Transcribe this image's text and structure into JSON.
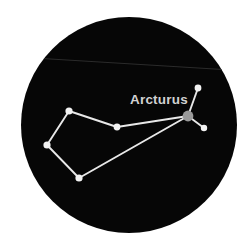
{
  "chart_data": {
    "type": "scatter",
    "title": "",
    "subtitle": "",
    "xlabel": "",
    "ylabel": "",
    "constellation": "Bootes",
    "view": {
      "shape": "circle",
      "center_x": 129,
      "center_y": 125,
      "radius": 108,
      "sky_color": "#060606",
      "page_background": "#ffffff"
    },
    "grid": false,
    "legend": null,
    "xlim": [
      0,
      252
    ],
    "ylim": [
      0,
      252
    ],
    "stars": [
      {
        "id": "arcturus",
        "label": "Arcturus",
        "x": 188,
        "y": 116,
        "radius": 5.4,
        "color": "#9a9a9a",
        "magnitude_rank": 1
      },
      {
        "id": "izar",
        "label": "",
        "x": 198,
        "y": 88,
        "radius": 3.4,
        "color": "#f2f2f2",
        "magnitude_rank": 2
      },
      {
        "id": "muphrid",
        "label": "",
        "x": 204,
        "y": 128,
        "radius": 3.2,
        "color": "#f2f2f2",
        "magnitude_rank": 3
      },
      {
        "id": "seginus",
        "label": "",
        "x": 117,
        "y": 127,
        "radius": 3.4,
        "color": "#f2f2f2",
        "magnitude_rank": 4
      },
      {
        "id": "nekkar",
        "label": "",
        "x": 69,
        "y": 111,
        "radius": 3.6,
        "color": "#f2f2f2",
        "magnitude_rank": 5
      },
      {
        "id": "asellus",
        "label": "",
        "x": 47,
        "y": 145,
        "radius": 3.6,
        "color": "#f2f2f2",
        "magnitude_rank": 6
      },
      {
        "id": "alkalurops",
        "label": "",
        "x": 79,
        "y": 178,
        "radius": 3.6,
        "color": "#f2f2f2",
        "magnitude_rank": 7
      }
    ],
    "lines": [
      {
        "from": "izar",
        "to": "arcturus"
      },
      {
        "from": "arcturus",
        "to": "muphrid"
      },
      {
        "from": "arcturus",
        "to": "seginus"
      },
      {
        "from": "seginus",
        "to": "nekkar"
      },
      {
        "from": "nekkar",
        "to": "asellus"
      },
      {
        "from": "asellus",
        "to": "alkalurops"
      },
      {
        "from": "alkalurops",
        "to": "arcturus"
      }
    ],
    "line_color": "#e8e8e8",
    "line_width": 1.9,
    "horizon_line": {
      "x1": 34,
      "y1": 58,
      "x2": 231,
      "y2": 70,
      "color": "#2b2b2b",
      "width": 1
    },
    "annotations": [
      {
        "id": "arcturus-label",
        "text": "Arcturus",
        "x": 130,
        "y": 104,
        "color": "#d2d2d2",
        "font_size": 13.5,
        "bold": true,
        "anchor": "start"
      }
    ]
  }
}
